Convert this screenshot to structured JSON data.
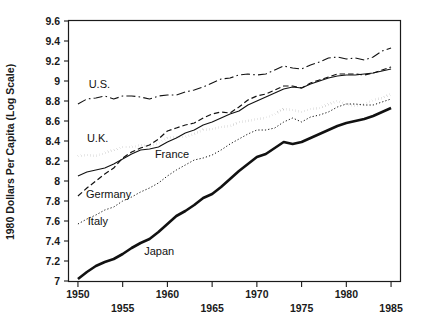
{
  "chart_data": {
    "type": "line",
    "title": "",
    "xlabel": "",
    "ylabel": "1980 Dollars Per Capita (Log Scale)",
    "xlim": [
      1949,
      1986
    ],
    "ylim": [
      7.0,
      9.6
    ],
    "grid": false,
    "legend_position": "inline-labels",
    "x_ticks": [
      1950,
      1955,
      1960,
      1965,
      1970,
      1975,
      1980,
      1985
    ],
    "x_tick_labels": [
      "1950",
      "1955",
      "1960",
      "1965",
      "1970",
      "1975",
      "1980",
      "1985"
    ],
    "y_ticks": [
      7,
      7.2,
      7.4,
      7.6,
      7.8,
      8,
      8.2,
      8.4,
      8.6,
      8.8,
      9,
      9.2,
      9.4,
      9.6
    ],
    "y_tick_labels": [
      "7",
      "7.2",
      "7.4",
      "7.6",
      "7.8",
      "8",
      "8.2",
      "8.4",
      "8.6",
      "8.8",
      "9",
      "9.2",
      "9.4",
      "9.6"
    ],
    "x": [
      1950,
      1951,
      1952,
      1953,
      1954,
      1955,
      1956,
      1957,
      1958,
      1959,
      1960,
      1961,
      1962,
      1963,
      1964,
      1965,
      1966,
      1967,
      1968,
      1969,
      1970,
      1971,
      1972,
      1973,
      1974,
      1975,
      1976,
      1977,
      1978,
      1979,
      1980,
      1981,
      1982,
      1983,
      1984,
      1985
    ],
    "series": [
      {
        "name": "U.S.",
        "line_style": "dash-dot",
        "line_width": 1.1,
        "color": "#111111",
        "label_x": 1951.2,
        "label_y": 8.93,
        "values": [
          8.77,
          8.82,
          8.83,
          8.85,
          8.82,
          8.85,
          8.85,
          8.84,
          8.82,
          8.85,
          8.86,
          8.86,
          8.89,
          8.91,
          8.94,
          8.98,
          9.02,
          9.03,
          9.06,
          9.07,
          9.06,
          9.07,
          9.11,
          9.15,
          9.13,
          9.12,
          9.16,
          9.19,
          9.23,
          9.24,
          9.22,
          9.23,
          9.21,
          9.24,
          9.3,
          9.33
        ]
      },
      {
        "name": "U.K.",
        "line_style": "dotted-thick",
        "line_width": 2.6,
        "color": "#111111",
        "label_x": 1951.0,
        "label_y": 8.39,
        "values": [
          8.25,
          8.26,
          8.25,
          8.28,
          8.31,
          8.34,
          8.34,
          8.36,
          8.35,
          8.38,
          8.43,
          8.44,
          8.44,
          8.47,
          8.51,
          8.52,
          8.54,
          8.55,
          8.59,
          8.6,
          8.62,
          8.63,
          8.67,
          8.72,
          8.71,
          8.69,
          8.72,
          8.73,
          8.77,
          8.8,
          8.77,
          8.75,
          8.77,
          8.81,
          8.83,
          8.87
        ]
      },
      {
        "name": "France",
        "line_style": "solid-thin",
        "line_width": 1.1,
        "color": "#111111",
        "label_x": 1958.6,
        "label_y": 8.23,
        "values": [
          8.05,
          8.09,
          8.11,
          8.13,
          8.17,
          8.22,
          8.27,
          8.31,
          8.32,
          8.34,
          8.39,
          8.43,
          8.48,
          8.51,
          8.56,
          8.59,
          8.63,
          8.67,
          8.7,
          8.76,
          8.8,
          8.84,
          8.88,
          8.92,
          8.94,
          8.93,
          8.97,
          9.0,
          9.03,
          9.05,
          9.06,
          9.06,
          9.07,
          9.08,
          9.1,
          9.12
        ]
      },
      {
        "name": "Germany",
        "line_style": "dashed",
        "line_width": 1.2,
        "color": "#111111",
        "label_x": 1950.9,
        "label_y": 7.83,
        "values": [
          7.85,
          7.93,
          8.0,
          8.07,
          8.13,
          8.23,
          8.29,
          8.33,
          8.36,
          8.42,
          8.5,
          8.53,
          8.56,
          8.58,
          8.63,
          8.67,
          8.69,
          8.68,
          8.74,
          8.81,
          8.85,
          8.87,
          8.91,
          8.95,
          8.95,
          8.93,
          8.98,
          9.01,
          9.04,
          9.07,
          9.07,
          9.07,
          9.06,
          9.08,
          9.11,
          9.14
        ]
      },
      {
        "name": "Italy",
        "line_style": "dotted-fine",
        "line_width": 1.0,
        "color": "#111111",
        "label_x": 1951.1,
        "label_y": 7.56,
        "values": [
          7.57,
          7.62,
          7.66,
          7.71,
          7.74,
          7.8,
          7.84,
          7.89,
          7.93,
          7.98,
          8.05,
          8.11,
          8.16,
          8.21,
          8.23,
          8.26,
          8.31,
          8.37,
          8.42,
          8.47,
          8.51,
          8.51,
          8.53,
          8.59,
          8.63,
          8.59,
          8.64,
          8.66,
          8.69,
          8.74,
          8.77,
          8.77,
          8.76,
          8.76,
          8.79,
          8.82
        ]
      },
      {
        "name": "Japan",
        "line_style": "solid-thick",
        "line_width": 2.6,
        "color": "#111111",
        "label_x": 1957.4,
        "label_y": 7.26,
        "values": [
          7.02,
          7.09,
          7.15,
          7.19,
          7.22,
          7.27,
          7.33,
          7.38,
          7.42,
          7.49,
          7.57,
          7.65,
          7.7,
          7.76,
          7.83,
          7.87,
          7.94,
          8.02,
          8.1,
          8.17,
          8.24,
          8.27,
          8.33,
          8.39,
          8.37,
          8.39,
          8.43,
          8.47,
          8.51,
          8.55,
          8.58,
          8.6,
          8.62,
          8.65,
          8.69,
          8.73
        ]
      }
    ]
  }
}
